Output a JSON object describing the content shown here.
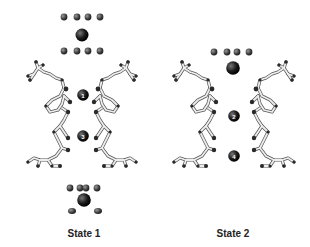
{
  "figure": {
    "panels": [
      {
        "label": "State 1",
        "ions": [
          {
            "number": "1"
          },
          {
            "number": "3"
          }
        ]
      },
      {
        "label": "State 2",
        "ions": [
          {
            "number": "2"
          },
          {
            "number": "4"
          }
        ]
      }
    ],
    "colors": {
      "ion": "#111111",
      "water": "#444444",
      "stick_light": "#e6e6e6",
      "stick_dark": "#2a2a2a",
      "label": "#222222"
    }
  }
}
